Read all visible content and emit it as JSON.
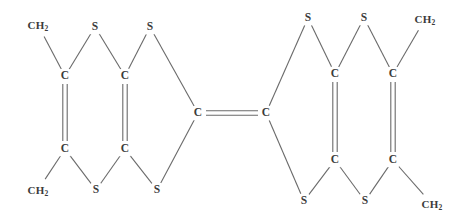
{
  "diagram": {
    "kind": "chemical-structure",
    "name": "bis-fused tetrathiafulvalene with methylene substituents",
    "background_color": "#ffffff",
    "bond_color": "#6a6a6a",
    "label_color": "#3b3b3b"
  },
  "atoms": [
    {
      "id": "ch2-tl",
      "label": "CH",
      "sub": "2",
      "type": "group",
      "x": 38,
      "y": 25
    },
    {
      "id": "s-t1",
      "label": "S",
      "sub": "",
      "type": "single",
      "x": 95,
      "y": 27
    },
    {
      "id": "s-t2",
      "label": "S",
      "sub": "",
      "type": "single",
      "x": 150,
      "y": 27
    },
    {
      "id": "c-l-tl",
      "label": "C",
      "sub": "",
      "type": "single",
      "x": 65,
      "y": 76
    },
    {
      "id": "c-l-tr",
      "label": "C",
      "sub": "",
      "type": "single",
      "x": 125,
      "y": 76
    },
    {
      "id": "c-l-bl",
      "label": "C",
      "sub": "",
      "type": "single",
      "x": 65,
      "y": 149
    },
    {
      "id": "c-l-br",
      "label": "C",
      "sub": "",
      "type": "single",
      "x": 125,
      "y": 149
    },
    {
      "id": "ch2-bl",
      "label": "CH",
      "sub": "2",
      "type": "group",
      "x": 38,
      "y": 190
    },
    {
      "id": "s-b1",
      "label": "S",
      "sub": "",
      "type": "single",
      "x": 96,
      "y": 190
    },
    {
      "id": "s-b2",
      "label": "S",
      "sub": "",
      "type": "single",
      "x": 157,
      "y": 190
    },
    {
      "id": "c-mid-l",
      "label": "C",
      "sub": "",
      "type": "single",
      "x": 198,
      "y": 113
    },
    {
      "id": "c-mid-r",
      "label": "C",
      "sub": "",
      "type": "single",
      "x": 266,
      "y": 113
    },
    {
      "id": "s-t3",
      "label": "S",
      "sub": "",
      "type": "single",
      "x": 308,
      "y": 18
    },
    {
      "id": "s-t4",
      "label": "S",
      "sub": "",
      "type": "single",
      "x": 364,
      "y": 18
    },
    {
      "id": "ch2-tr",
      "label": "CH",
      "sub": "2",
      "type": "group",
      "x": 425,
      "y": 19
    },
    {
      "id": "c-r-tl",
      "label": "C",
      "sub": "",
      "type": "single",
      "x": 335,
      "y": 74
    },
    {
      "id": "c-r-tr",
      "label": "C",
      "sub": "",
      "type": "single",
      "x": 393,
      "y": 74
    },
    {
      "id": "c-r-bl",
      "label": "C",
      "sub": "",
      "type": "single",
      "x": 335,
      "y": 160
    },
    {
      "id": "c-r-br",
      "label": "C",
      "sub": "",
      "type": "single",
      "x": 393,
      "y": 160
    },
    {
      "id": "s-b3",
      "label": "S",
      "sub": "",
      "type": "single",
      "x": 304,
      "y": 201
    },
    {
      "id": "s-b4",
      "label": "S",
      "sub": "",
      "type": "single",
      "x": 365,
      "y": 201
    },
    {
      "id": "ch2-br",
      "label": "CH",
      "sub": "2",
      "type": "group",
      "x": 432,
      "y": 204
    }
  ],
  "bonds": [
    {
      "from": "ch2-tl",
      "to": "c-l-tl",
      "order": 1
    },
    {
      "from": "c-l-tl",
      "to": "s-t1",
      "order": 1
    },
    {
      "from": "s-t1",
      "to": "c-l-tr",
      "order": 1
    },
    {
      "from": "c-l-tr",
      "to": "s-t2",
      "order": 1
    },
    {
      "from": "s-t2",
      "to": "c-mid-l",
      "order": 1
    },
    {
      "from": "c-l-tl",
      "to": "c-l-bl",
      "order": 2
    },
    {
      "from": "c-l-tr",
      "to": "c-l-br",
      "order": 2
    },
    {
      "from": "ch2-bl",
      "to": "c-l-bl",
      "order": 1
    },
    {
      "from": "c-l-bl",
      "to": "s-b1",
      "order": 1
    },
    {
      "from": "s-b1",
      "to": "c-l-br",
      "order": 1
    },
    {
      "from": "c-l-br",
      "to": "s-b2",
      "order": 1
    },
    {
      "from": "s-b2",
      "to": "c-mid-l",
      "order": 1
    },
    {
      "from": "c-mid-l",
      "to": "c-mid-r",
      "order": 2
    },
    {
      "from": "c-mid-r",
      "to": "s-t3",
      "order": 1
    },
    {
      "from": "s-t3",
      "to": "c-r-tl",
      "order": 1
    },
    {
      "from": "c-r-tl",
      "to": "s-t4",
      "order": 1
    },
    {
      "from": "s-t4",
      "to": "c-r-tr",
      "order": 1
    },
    {
      "from": "c-r-tr",
      "to": "ch2-tr",
      "order": 1
    },
    {
      "from": "c-r-tl",
      "to": "c-r-bl",
      "order": 2
    },
    {
      "from": "c-r-tr",
      "to": "c-r-br",
      "order": 2
    },
    {
      "from": "c-mid-r",
      "to": "s-b3",
      "order": 1
    },
    {
      "from": "s-b3",
      "to": "c-r-bl",
      "order": 1
    },
    {
      "from": "c-r-bl",
      "to": "s-b4",
      "order": 1
    },
    {
      "from": "s-b4",
      "to": "c-r-br",
      "order": 1
    },
    {
      "from": "c-r-br",
      "to": "ch2-br",
      "order": 1
    }
  ]
}
